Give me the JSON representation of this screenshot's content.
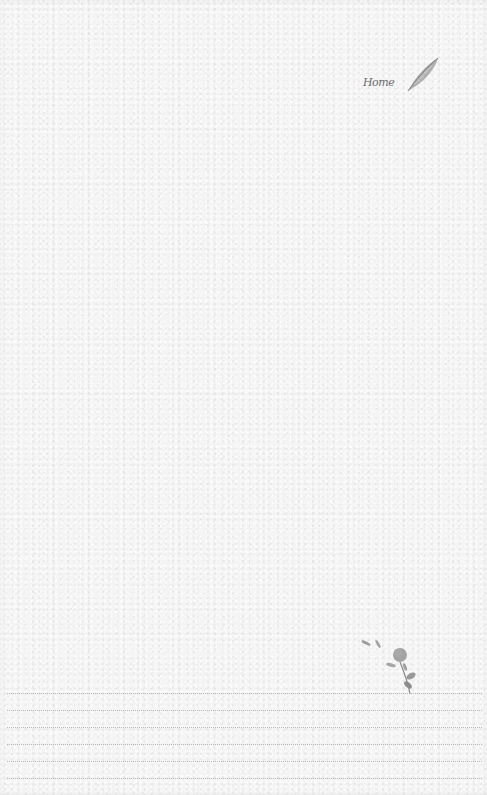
{
  "page": {
    "type": "stationery-notepaper",
    "background_color": "#f4f4f4",
    "line_color": "#b8b8b8",
    "ink_color": "#6a6a6a"
  },
  "header": {
    "signature_text": "Home",
    "icon": "quill-icon"
  },
  "footer": {
    "icon": "rose-sprig-icon",
    "writing_lines_count": 6,
    "writing_lines": [
      "",
      "",
      "",
      "",
      "",
      ""
    ]
  }
}
